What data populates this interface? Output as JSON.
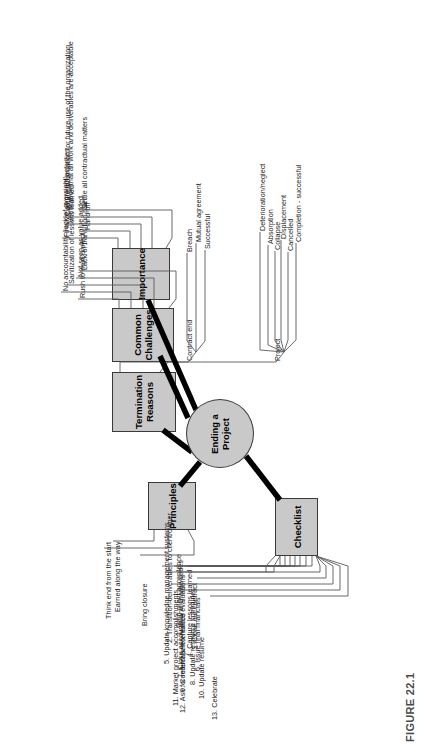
{
  "figure": {
    "caption": "FIGURE 22.1"
  },
  "center": {
    "label_line1": "Ending a",
    "label_line2": "Project"
  },
  "colors": {
    "node_fill": "#c9c9c9",
    "node_stroke": "#3a3a3a",
    "trunk": "#000000",
    "text": "#1a1a1a"
  },
  "branches": [
    {
      "id": "importance",
      "label": "Importance",
      "leaves": [
        "Finalize all project activities",
        "Hand off",
        "Verification that all work and deliverables are acceptable",
        "Capture information for future use of the organization",
        "Settle all contractual matters"
      ]
    },
    {
      "id": "common-challenges",
      "label_line1": "Common",
      "label_line2": "Challenges",
      "leaves": [
        "Rush to next project",
        "No accountability (lack of oversight)",
        "Sanitization of lessons learned",
        "Not seen as value-added",
        "Lack of transition plan"
      ]
    },
    {
      "id": "termination-reasons",
      "label_line1": "Termination",
      "label_line2": "Reasons",
      "groups": [
        {
          "name": "Contract end",
          "leaves": [
            "Successful",
            "Mutual agreement",
            "Breach"
          ]
        },
        {
          "name": "Project",
          "leaves": [
            "Completion - successful",
            "Cancelled",
            "Displacement",
            "Collapse",
            "Absorption",
            "Deterioration/neglect"
          ]
        }
      ]
    },
    {
      "id": "principles",
      "label": "Principles",
      "leaves": [
        "Earned along the way",
        "Think end from the start",
        "Bring closure"
      ]
    },
    {
      "id": "checklist",
      "label": "Checklist",
      "leaves": [
        "1. Gain client acceptance",
        "2. Transition deliverables to client/owner",
        "3. Close out contract",
        "4. Capture lessons learned",
        "5. Update knowledge management systems",
        "6. Issue final financials",
        "7. Close accounts and charge codes",
        "8. Update resource schedules",
        "9. Conduct performance evaluations",
        "10. Update resume",
        "11. Market project accomplishments",
        "12. Ask for referrals/references",
        "13. Celebrate"
      ]
    }
  ]
}
